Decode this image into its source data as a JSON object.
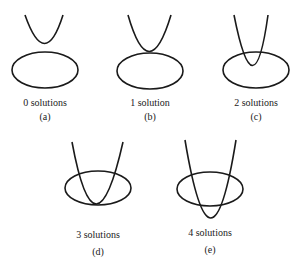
{
  "figure": {
    "stroke_color": "#1a1a1a",
    "background": "#ffffff",
    "panels": [
      {
        "id": "a",
        "caption": "0 solutions",
        "letter": "(a)"
      },
      {
        "id": "b",
        "caption": "1 solution",
        "letter": "(b)"
      },
      {
        "id": "c",
        "caption": "2 solutions",
        "letter": "(c)"
      },
      {
        "id": "d",
        "caption": "3 solutions",
        "letter": "(d)"
      },
      {
        "id": "e",
        "caption": "4 solutions",
        "letter": "(e)"
      }
    ]
  }
}
